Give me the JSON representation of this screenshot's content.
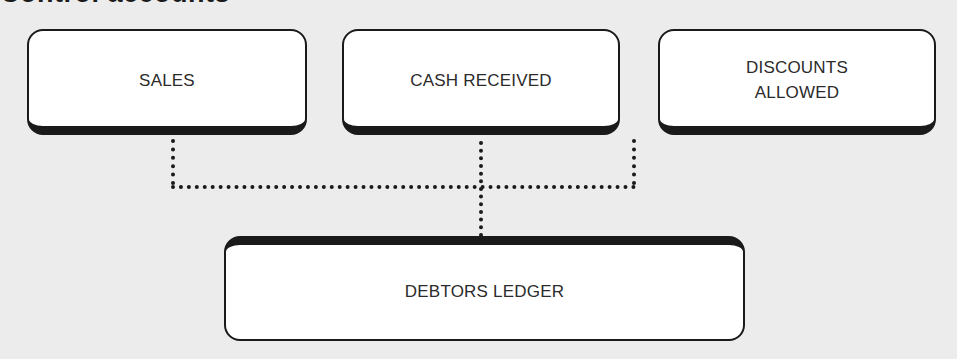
{
  "diagram": {
    "title": "Control accounts",
    "sources": [
      {
        "id": "sales",
        "label": "SALES"
      },
      {
        "id": "cash-received",
        "label": "CASH RECEIVED"
      },
      {
        "id": "discounts-allowed",
        "label": "DISCOUNTS\nALLOWED"
      }
    ],
    "target": {
      "id": "debtors-ledger",
      "label": "DEBTORS LEDGER"
    },
    "connectors": {
      "style": "dotted",
      "from": [
        "sales",
        "cash-received",
        "discounts-allowed"
      ],
      "to": "debtors-ledger"
    },
    "colors": {
      "background": "#ececec",
      "box_fill": "#ffffff",
      "outline": "#1a1a1a",
      "text": "#2b2b2b"
    }
  }
}
